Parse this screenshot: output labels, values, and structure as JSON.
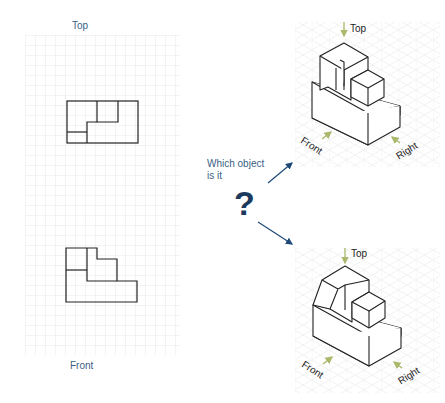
{
  "left_panel": {
    "top_label": "Top",
    "front_label": "Front"
  },
  "center": {
    "question_text_line1": "Which object",
    "question_text_line2": "is it",
    "question_mark": "?"
  },
  "option_a": {
    "top_label": "Top",
    "front_label": "Front",
    "right_label": "Right"
  },
  "option_b": {
    "top_label": "Top",
    "front_label": "Front",
    "right_label": "Right"
  },
  "colors": {
    "label_blue": "#3a5f85",
    "arrow_navy": "#1f4a78",
    "question_navy": "#1c3a5e",
    "view_arrow_green": "#a9b86a",
    "grid_gray": "#e6e6e6"
  }
}
